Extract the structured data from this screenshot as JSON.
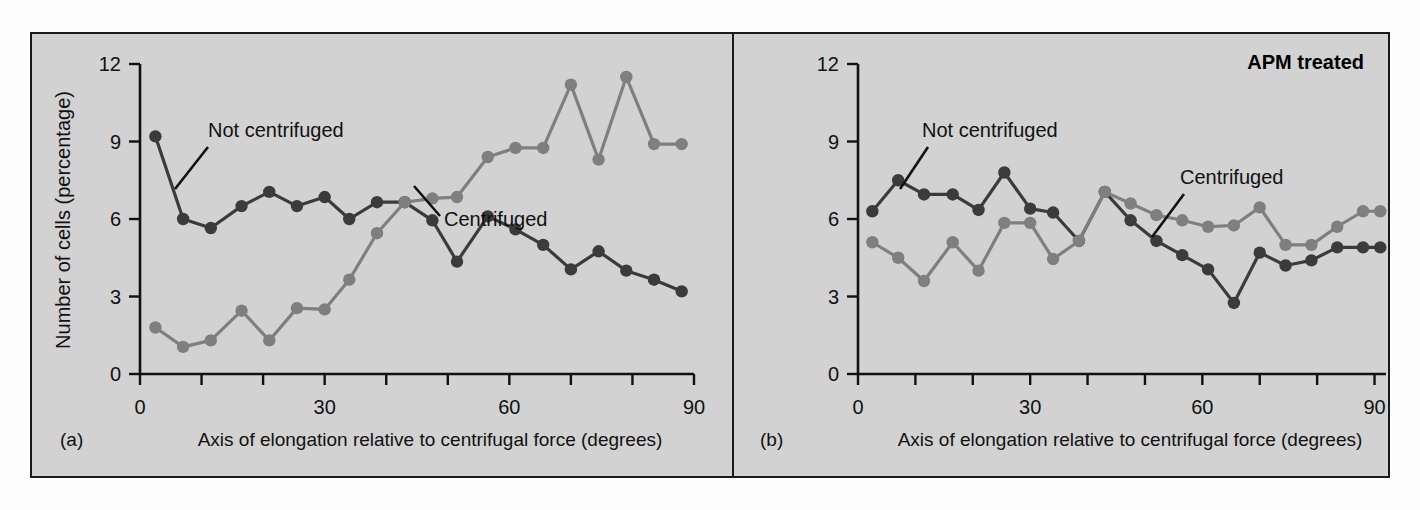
{
  "figure": {
    "background_color": "#d2d2d2",
    "border_color": "#1a1a1a"
  },
  "colors": {
    "not_centrifuged": "#3b3b3b",
    "centrifuged": "#7f7f7f",
    "text": "#111111"
  },
  "panel_a": {
    "panel_label": "(a)",
    "ylabel": "Number of cells (percentage)",
    "xlabel": "Axis of elongation relative to centrifugal force (degrees)",
    "annotation_not_centrifuged": "Not centrifuged",
    "annotation_centrifuged": "Centrifuged",
    "yticks": [
      "0",
      "3",
      "6",
      "9",
      "12"
    ],
    "xticks_labeled": [
      "0",
      "30",
      "60",
      "90"
    ]
  },
  "panel_b": {
    "panel_label": "(b)",
    "title_note": "APM treated",
    "xlabel": "Axis of elongation relative to centrifugal force (degrees)",
    "annotation_not_centrifuged": "Not centrifuged",
    "annotation_centrifuged": "Centrifuged",
    "yticks": [
      "0",
      "3",
      "6",
      "9",
      "12"
    ],
    "xticks_labeled": [
      "0",
      "30",
      "60",
      "90"
    ]
  },
  "chart_data": [
    {
      "type": "line",
      "id": "panel-a",
      "title": "(a)",
      "xlabel": "Axis of elongation relative to centrifugal force (degrees)",
      "ylabel": "Number of cells (percentage)",
      "xlim": [
        0,
        90
      ],
      "ylim": [
        0,
        12
      ],
      "xticks": [
        0,
        10,
        20,
        30,
        40,
        50,
        60,
        70,
        80,
        90
      ],
      "xtick_labels": [
        "0",
        "",
        "",
        "30",
        "",
        "",
        "60",
        "",
        "",
        "90"
      ],
      "yticks": [
        0,
        3,
        6,
        9,
        12
      ],
      "grid": false,
      "legend": "annotated-callouts",
      "series": [
        {
          "name": "Not centrifuged",
          "color": "#3b3b3b",
          "x": [
            2.5,
            7,
            11.5,
            16.5,
            21,
            25.5,
            30,
            34,
            38.5,
            43,
            47.5,
            51.5,
            56.5,
            61,
            65.5,
            70,
            74.5,
            79,
            83.5,
            88
          ],
          "y": [
            9.2,
            6.0,
            5.65,
            6.5,
            7.05,
            6.5,
            6.85,
            6.0,
            6.65,
            6.65,
            5.95,
            4.35,
            6.1,
            5.6,
            5.0,
            4.05,
            4.75,
            4.0,
            3.65,
            3.2
          ]
        },
        {
          "name": "Centrifuged",
          "color": "#7f7f7f",
          "x": [
            2.5,
            7,
            11.5,
            16.5,
            21,
            25.5,
            30,
            34,
            38.5,
            43,
            47.5,
            51.5,
            56.5,
            61,
            65.5,
            70,
            74.5,
            79,
            83.5,
            88
          ],
          "y": [
            1.8,
            1.05,
            1.3,
            2.45,
            1.3,
            2.55,
            2.5,
            3.65,
            5.45,
            6.65,
            6.8,
            6.85,
            8.4,
            8.75,
            8.75,
            11.2,
            8.3,
            11.5,
            8.9,
            8.9
          ]
        }
      ]
    },
    {
      "type": "line",
      "id": "panel-b",
      "title": "(b)",
      "note": "APM treated",
      "xlabel": "Axis of elongation relative to centrifugal force (degrees)",
      "ylabel": "",
      "xlim": [
        0,
        90
      ],
      "ylim": [
        0,
        12
      ],
      "xticks": [
        0,
        10,
        20,
        30,
        40,
        50,
        60,
        70,
        80,
        90
      ],
      "xtick_labels": [
        "0",
        "",
        "",
        "30",
        "",
        "",
        "60",
        "",
        "",
        "90"
      ],
      "yticks": [
        0,
        3,
        6,
        9,
        12
      ],
      "grid": false,
      "legend": "annotated-callouts",
      "series": [
        {
          "name": "Not centrifuged",
          "color": "#3b3b3b",
          "x": [
            2.5,
            7,
            11.5,
            16.5,
            21,
            25.5,
            30,
            34,
            38.5,
            43,
            47.5,
            52,
            56.5,
            61,
            65.5,
            70,
            74.5,
            79,
            83.5,
            88,
            91
          ],
          "y": [
            6.3,
            7.5,
            6.95,
            6.95,
            6.35,
            7.8,
            6.4,
            6.25,
            5.15,
            7.05,
            5.95,
            5.15,
            4.6,
            4.05,
            2.75,
            4.7,
            4.2,
            4.4,
            4.9,
            4.9,
            4.9
          ]
        },
        {
          "name": "Centrifuged",
          "color": "#7f7f7f",
          "x": [
            2.5,
            7,
            11.5,
            16.5,
            21,
            25.5,
            30,
            34,
            38.5,
            43,
            47.5,
            52,
            56.5,
            61,
            65.5,
            70,
            74.5,
            79,
            83.5,
            88,
            91
          ],
          "y": [
            5.1,
            4.5,
            3.6,
            5.1,
            4.0,
            5.85,
            5.85,
            4.45,
            5.15,
            7.05,
            6.6,
            6.15,
            5.95,
            5.7,
            5.75,
            6.45,
            5.0,
            5.0,
            5.7,
            6.3,
            6.3
          ]
        }
      ]
    }
  ]
}
